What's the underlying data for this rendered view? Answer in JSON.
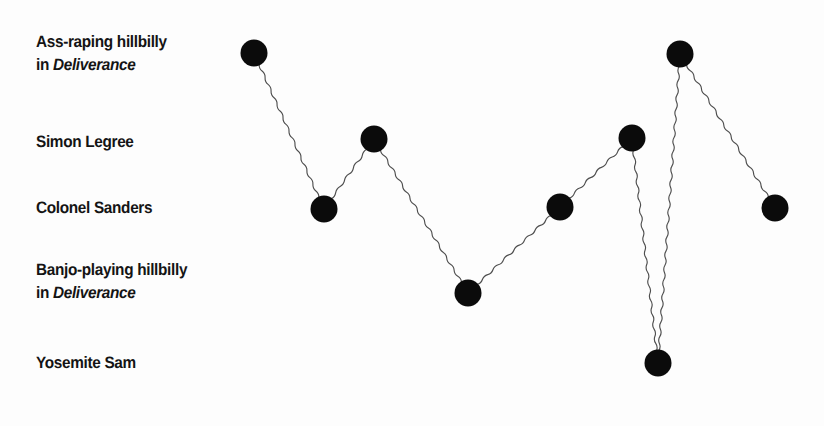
{
  "figure": {
    "background_color": "#fdfdfd",
    "ink_color": "#0b0b0b",
    "line_color": "#4e4e4e"
  },
  "y_axis": {
    "labels": [
      {
        "id": "ass-raping-hillbilly",
        "line1": "Ass-raping hillbilly",
        "line2_prefix": "in ",
        "line2_italic": "Deliverance",
        "y": 53
      },
      {
        "id": "simon-legree",
        "line1": "Simon Legree",
        "line2_prefix": "",
        "line2_italic": "",
        "y": 142
      },
      {
        "id": "colonel-sanders",
        "line1": "Colonel Sanders",
        "line2_prefix": "",
        "line2_italic": "",
        "y": 208
      },
      {
        "id": "banjo-playing-hillbilly",
        "line1": "Banjo-playing hillbilly",
        "line2_prefix": "in ",
        "line2_italic": "Deliverance",
        "y": 281
      },
      {
        "id": "yosemite-sam",
        "line1": "Yosemite Sam",
        "line2_prefix": "",
        "line2_italic": "",
        "y": 363
      }
    ]
  },
  "chart_data": {
    "type": "line",
    "title": "",
    "xlabel": "",
    "ylabel": "",
    "grid": false,
    "legend": null,
    "marker": "filled-circle",
    "marker_radius": 13.5,
    "line_style": "hand-drawn-wavy",
    "y_categories": [
      "Ass-raping hillbilly in Deliverance",
      "Simon Legree",
      "Colonel Sanders",
      "Banjo-playing hillbilly in Deliverance",
      "Yosemite Sam"
    ],
    "y_category_pixels": [
      53,
      139,
      208,
      293,
      363
    ],
    "x": [
      1,
      2,
      3,
      4,
      5,
      6,
      7,
      8,
      9
    ],
    "values": [
      "Ass-raping hillbilly in Deliverance",
      "Colonel Sanders",
      "Simon Legree",
      "Banjo-playing hillbilly in Deliverance",
      "Colonel Sanders",
      "Simon Legree",
      "Yosemite Sam",
      "Ass-raping hillbilly in Deliverance",
      "Colonel Sanders"
    ],
    "points": [
      {
        "index": 1,
        "cx": 254,
        "cy": 53,
        "category": "Ass-raping hillbilly in Deliverance"
      },
      {
        "index": 2,
        "cx": 324,
        "cy": 209,
        "category": "Colonel Sanders"
      },
      {
        "index": 3,
        "cx": 374,
        "cy": 139,
        "category": "Simon Legree"
      },
      {
        "index": 4,
        "cx": 468,
        "cy": 293,
        "category": "Banjo-playing hillbilly in Deliverance"
      },
      {
        "index": 5,
        "cx": 560,
        "cy": 207,
        "category": "Colonel Sanders"
      },
      {
        "index": 6,
        "cx": 632,
        "cy": 138,
        "category": "Simon Legree"
      },
      {
        "index": 7,
        "cx": 658,
        "cy": 363,
        "category": "Yosemite Sam"
      },
      {
        "index": 8,
        "cx": 680,
        "cy": 54,
        "category": "Ass-raping hillbilly in Deliverance"
      },
      {
        "index": 9,
        "cx": 775,
        "cy": 208,
        "category": "Colonel Sanders"
      }
    ]
  }
}
